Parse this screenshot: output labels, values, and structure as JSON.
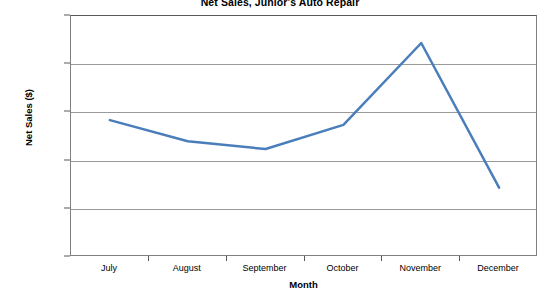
{
  "chart_data": {
    "type": "line",
    "title": "Net Sales, Junior's Auto Repair",
    "xlabel": "Month",
    "ylabel": "Net Sales ($)",
    "categories": [
      "July",
      "August",
      "September",
      "October",
      "November",
      "December"
    ],
    "values": [
      24200,
      22000,
      21200,
      23700,
      32200,
      17200
    ],
    "series": [
      {
        "name": "Net Sales",
        "values": [
          24200,
          22000,
          21200,
          23700,
          32200,
          17200
        ]
      }
    ],
    "ylim": [
      10000,
      35000
    ],
    "ytick_step": 5000,
    "ytick_labels": [
      "35,000",
      "30,000",
      "25,000",
      "20,000",
      "15,000",
      "10,000"
    ],
    "ytick_values": [
      35000,
      30000,
      25000,
      20000,
      15000,
      10000
    ],
    "grid": "horizontal",
    "legend": "none",
    "line_color": "#4A7EBB",
    "line_width": 2.5,
    "markers": false,
    "plot_background": "#ffffff",
    "gridline_color": "#9A9A9A",
    "axis_color": "#595959"
  }
}
